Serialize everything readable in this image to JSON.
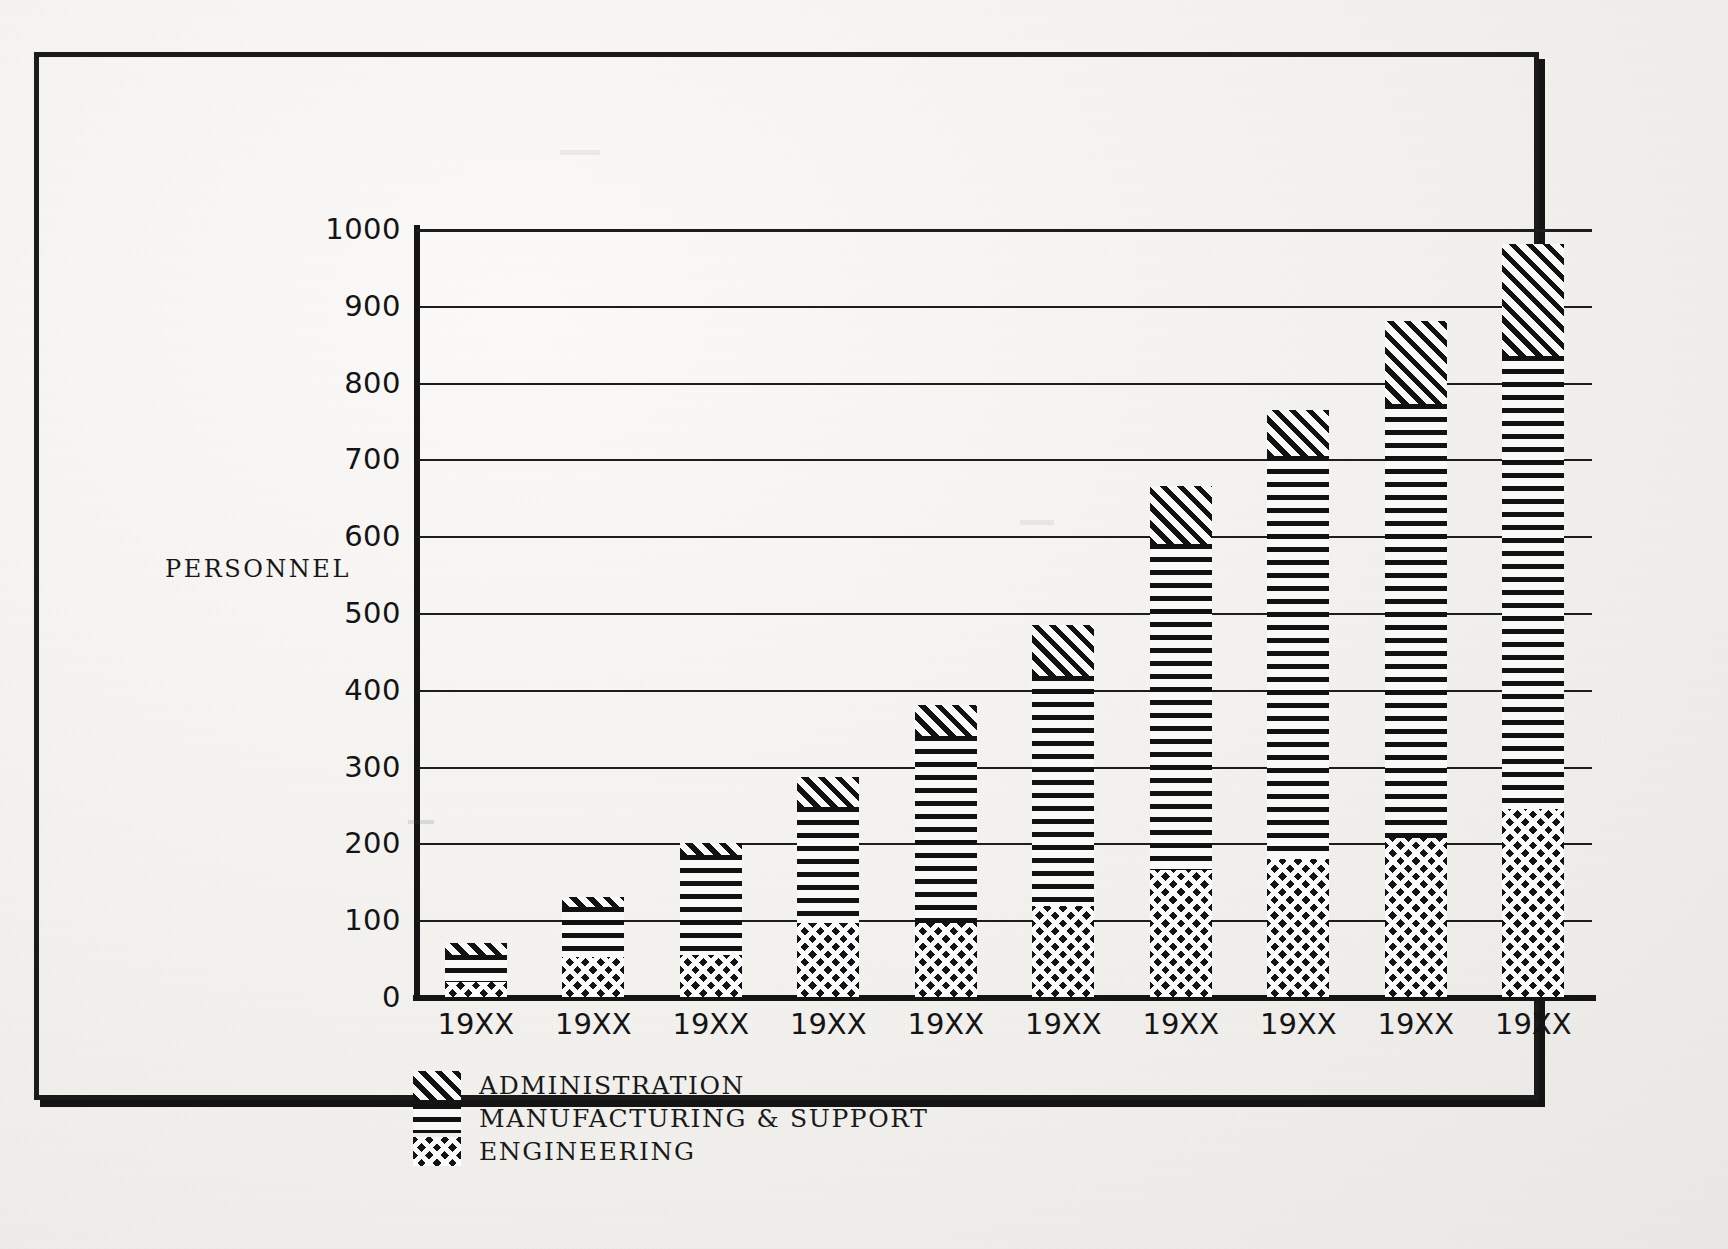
{
  "chart_data": {
    "type": "bar",
    "title": "",
    "subtitle": "",
    "xlabel": "",
    "ylabel": "PERSONNEL",
    "ylim": [
      0,
      1000
    ],
    "ytick_step": 100,
    "yticks": [
      "0",
      "100",
      "200",
      "300",
      "400",
      "500",
      "600",
      "700",
      "800",
      "900",
      "1000"
    ],
    "grid": true,
    "stacked": true,
    "legend_position": "below-left",
    "categories": [
      "19XX",
      "19XX",
      "19XX",
      "19XX",
      "19XX",
      "19XX",
      "19XX",
      "19XX",
      "19XX",
      "19XX"
    ],
    "series": [
      {
        "name": "ENGINEERING",
        "pattern": "cross-hatch",
        "values": [
          20,
          52,
          55,
          97,
          97,
          118,
          165,
          180,
          207,
          245
        ]
      },
      {
        "name": "MANUFACTURING & SUPPORT",
        "pattern": "horizontal-lines",
        "values": [
          35,
          65,
          130,
          150,
          243,
          300,
          425,
          525,
          565,
          590
        ]
      },
      {
        "name": "ADMINISTRATION",
        "pattern": "diagonal-hatch",
        "values": [
          15,
          13,
          15,
          40,
          40,
          67,
          75,
          60,
          108,
          145
        ]
      }
    ],
    "stack_totals": [
      70,
      130,
      200,
      287,
      380,
      485,
      665,
      765,
      880,
      980
    ],
    "annotations": []
  },
  "legend": {
    "items": [
      {
        "label": "ADMINISTRATION",
        "pattern": "diagonal-hatch"
      },
      {
        "label": "MANUFACTURING & SUPPORT",
        "pattern": "horizontal-lines"
      },
      {
        "label": "ENGINEERING",
        "pattern": "cross-hatch"
      }
    ]
  },
  "caption": "Figure 33-12.  Manpower by Budget  1/N — 1/2",
  "colors": {
    "ink": "#141414",
    "paper": "#f3f2f0"
  }
}
